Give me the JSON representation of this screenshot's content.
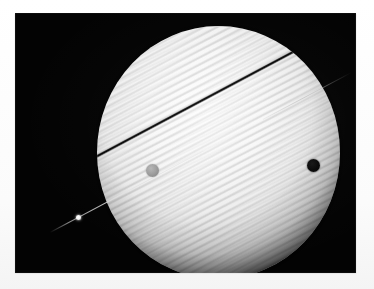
{
  "image": {
    "title": "Saturn with edge-on rings, transiting moon and moon shadow",
    "caption": "",
    "width_px": 374,
    "height_px": 289,
    "background_color": "#ffffff",
    "sky_color": "#030303",
    "print_area": {
      "left_px": 15,
      "top_px": 13,
      "width_px": 341,
      "height_px": 260
    }
  },
  "scene": {
    "planet": {
      "name": "saturn-disk",
      "center_px": [
        217,
        152
      ],
      "radius_px": 121,
      "highlight_color": "#fdfdfd",
      "limb_color": "#8d8d8d",
      "band_description": "fine diagonal cloud banding parallel to the ring plane",
      "band_angle_deg": -28
    },
    "ring": {
      "name": "ring-plane",
      "orientation": "edge-on",
      "angle_deg": -28,
      "left_tip_px": [
        50,
        232
      ],
      "right_tip_px": [
        352,
        72
      ],
      "line_color": "#ebebeb",
      "shadow_color": "#040404",
      "shadow_description": "dark ring shadow band crossing the planet disk"
    },
    "features": [
      {
        "name": "moon-transit",
        "label": "Moon in transit",
        "type": "grey-disk",
        "center_px": [
          138,
          171
        ],
        "radius_px": 6.5,
        "color": "#9e9e9e"
      },
      {
        "name": "moon-shadow",
        "label": "Moon shadow",
        "type": "black-disk",
        "center_px": [
          314,
          166
        ],
        "radius_px": 6.5,
        "color": "#060606"
      },
      {
        "name": "moon-on-ring",
        "label": "Moon on ring ansa",
        "type": "bright-point",
        "center_px": [
          79,
          218
        ],
        "radius_px": 2.5,
        "color": "#ffffff"
      }
    ]
  }
}
